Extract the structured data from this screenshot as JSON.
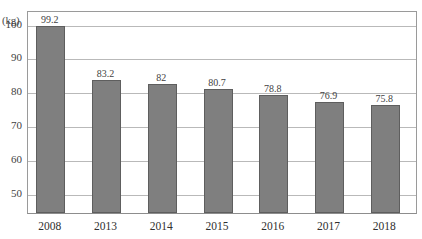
{
  "chart_data": {
    "type": "bar",
    "title": "",
    "subtitle": "",
    "xlabel": "",
    "ylabel": "(kg)",
    "unit_label": "(kg)",
    "categories": [
      "2008",
      "2013",
      "2014",
      "2015",
      "2016",
      "2017",
      "2018"
    ],
    "values": [
      99.2,
      83.2,
      82,
      80.7,
      78.8,
      76.9,
      75.8
    ],
    "value_labels": [
      "99.2",
      "83.2",
      "82",
      "80.7",
      "78.8",
      "76.9",
      "75.8"
    ],
    "ylim": [
      44,
      104
    ],
    "yticks": [
      100,
      90,
      80,
      70,
      60,
      50
    ],
    "ytick_labels": [
      "100",
      "90",
      "80",
      "70",
      "60",
      "50"
    ],
    "grid": true,
    "legend": null,
    "legend_position": "none",
    "series": [
      {
        "name": "",
        "values": [
          99.2,
          83.2,
          82,
          80.7,
          78.8,
          76.9,
          75.8
        ]
      }
    ],
    "colors": {
      "bar_fill": "#7f7f7f",
      "bar_border": "#5e5e5e",
      "gridline": "#b9b9b9",
      "axis": "#9a9a9a",
      "text": "#3f3f3f",
      "background": "#ffffff"
    }
  }
}
